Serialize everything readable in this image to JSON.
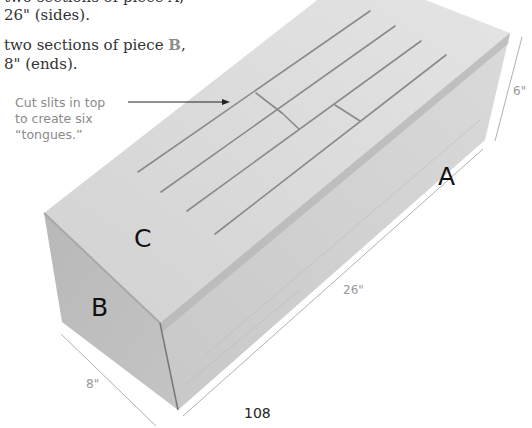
{
  "text": {
    "line1_partial": "two sections of piece A,",
    "line2": "26\" (sides).",
    "line3_prefix": "two sections of piece ",
    "line3_piece": "B",
    "line3_suffix": ",",
    "line4": "8\" (ends)."
  },
  "callout": {
    "line1": "Cut slits in top",
    "line2": "to create six",
    "line3": "“tongues.”"
  },
  "labels": {
    "side": "A",
    "end": "B",
    "top": "C"
  },
  "dimensions": {
    "height": "6\"",
    "length": "26\"",
    "width": "8\""
  },
  "page_number": "108",
  "colors": {
    "piece_letter": "#8c8c8c",
    "wood_top": "#d9d9d9",
    "wood_side": "#cfcfcf",
    "wood_end": "#bdbdbd"
  }
}
